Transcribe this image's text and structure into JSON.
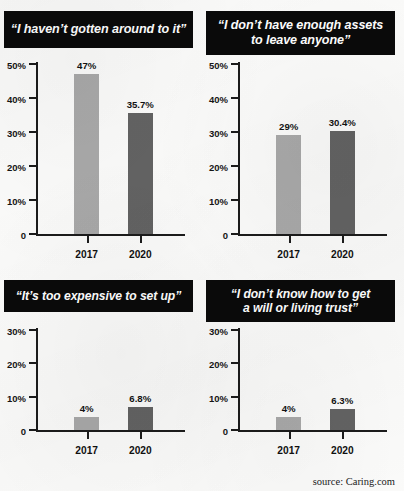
{
  "source_note": "source: Caring.com",
  "colors": {
    "banner_background": "#0a0a0a",
    "banner_text": "#ffffff",
    "bar_2017": "#a9a9a9",
    "bar_2020": "#636363",
    "axis": "#1b1b1b",
    "page_background": "#fbfbfa"
  },
  "panels": [
    {
      "title_lines": [
        "“I haven’t gotten around to it”"
      ],
      "chart_data": {
        "type": "bar",
        "title": "“I haven’t gotten around to it”",
        "categories": [
          "2017",
          "2020"
        ],
        "values": [
          47,
          35.7
        ],
        "value_labels": [
          "47%",
          "35.7%"
        ],
        "xlabel": "",
        "ylabel": "",
        "ylim": [
          0,
          50
        ],
        "yticks": [
          0,
          10,
          20,
          30,
          40,
          50
        ],
        "ytick_labels": [
          "0",
          "10%",
          "20%",
          "30%",
          "40%",
          "50%"
        ],
        "grid": false,
        "legend": "none",
        "series_colors": [
          "#a9a9a9",
          "#636363"
        ]
      }
    },
    {
      "title_lines": [
        "“I don’t have enough assets",
        "to leave anyone”"
      ],
      "chart_data": {
        "type": "bar",
        "title": "“I don’t have enough assets to leave anyone”",
        "categories": [
          "2017",
          "2020"
        ],
        "values": [
          29,
          30.4
        ],
        "value_labels": [
          "29%",
          "30.4%"
        ],
        "xlabel": "",
        "ylabel": "",
        "ylim": [
          0,
          50
        ],
        "yticks": [
          0,
          10,
          20,
          30,
          40,
          50
        ],
        "ytick_labels": [
          "0",
          "10%",
          "20%",
          "30%",
          "40%",
          "50%"
        ],
        "grid": false,
        "legend": "none",
        "series_colors": [
          "#a9a9a9",
          "#636363"
        ]
      }
    },
    {
      "title_lines": [
        "“It’s too expensive to set up”"
      ],
      "chart_data": {
        "type": "bar",
        "title": "“It’s too expensive to set up”",
        "categories": [
          "2017",
          "2020"
        ],
        "values": [
          4,
          6.8
        ],
        "value_labels": [
          "4%",
          "6.8%"
        ],
        "xlabel": "",
        "ylabel": "",
        "ylim": [
          0,
          30
        ],
        "yticks": [
          0,
          10,
          20,
          30
        ],
        "ytick_labels": [
          "0",
          "10%",
          "20%",
          "30%"
        ],
        "grid": false,
        "legend": "none",
        "series_colors": [
          "#a9a9a9",
          "#636363"
        ]
      }
    },
    {
      "title_lines": [
        "“I don’t know how to get",
        "a will or living trust”"
      ],
      "chart_data": {
        "type": "bar",
        "title": "“I don’t know how to get a will or living trust”",
        "categories": [
          "2017",
          "2020"
        ],
        "values": [
          4,
          6.3
        ],
        "value_labels": [
          "4%",
          "6.3%"
        ],
        "xlabel": "",
        "ylabel": "",
        "ylim": [
          0,
          30
        ],
        "yticks": [
          0,
          10,
          20,
          30
        ],
        "ytick_labels": [
          "0",
          "10%",
          "20%",
          "30%"
        ],
        "grid": false,
        "legend": "none",
        "series_colors": [
          "#a9a9a9",
          "#636363"
        ]
      }
    }
  ]
}
